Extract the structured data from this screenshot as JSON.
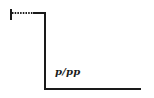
{
  "diagram": {
    "type": "dynamic-level-contour",
    "label": "p/pp",
    "stroke_color": "#1a1a1a",
    "background": "#ffffff",
    "segments": {
      "start_tick": {
        "x": 11,
        "y1": 9,
        "y2": 20
      },
      "dotted_segment": {
        "x1": 12,
        "x2": 33,
        "y": 13
      },
      "solid_top_segment": {
        "x1": 33,
        "x2": 45,
        "y": 13
      },
      "drop_segment": {
        "x": 45,
        "y1": 13,
        "y2": 89
      },
      "bottom_segment": {
        "x1": 45,
        "x2": 141,
        "y": 89
      }
    }
  }
}
